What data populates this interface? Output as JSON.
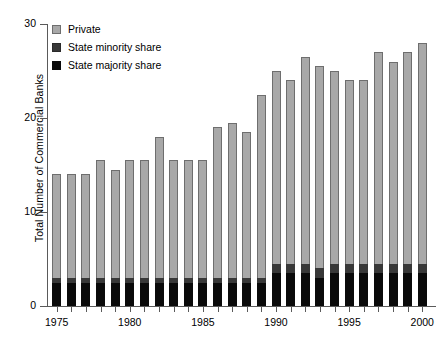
{
  "chart_data": {
    "type": "bar",
    "stacked": true,
    "title": "",
    "xlabel": "",
    "ylabel": "Total Number of Commercial Banks",
    "ylim": [
      0,
      30
    ],
    "yticks": [
      0,
      10,
      20,
      30
    ],
    "ytick_labels": [
      "0",
      "10",
      "20",
      "30"
    ],
    "grid": false,
    "legend_position": "top-left",
    "categories": [
      1975,
      1976,
      1977,
      1978,
      1979,
      1980,
      1981,
      1982,
      1983,
      1984,
      1985,
      1986,
      1987,
      1988,
      1989,
      1990,
      1991,
      1992,
      1993,
      1994,
      1995,
      1996,
      1997,
      1998,
      1999,
      2000
    ],
    "xtick_labels": [
      "1975",
      "1980",
      "1985",
      "1990",
      "1995",
      "2000"
    ],
    "xtick_values": [
      1975,
      1980,
      1985,
      1990,
      1995,
      2000
    ],
    "series": [
      {
        "name": "State majority share",
        "color": "#0a0a0a",
        "values": [
          2.5,
          2.5,
          2.5,
          2.5,
          2.5,
          2.5,
          2.5,
          2.5,
          2.5,
          2.5,
          2.5,
          2.5,
          2.5,
          2.5,
          2.5,
          3.5,
          3.5,
          3.5,
          3.0,
          3.5,
          3.5,
          3.5,
          3.5,
          3.5,
          3.5,
          3.5
        ]
      },
      {
        "name": "State minority share",
        "color": "#383838",
        "values": [
          0.5,
          0.5,
          0.5,
          0.5,
          0.5,
          0.5,
          0.5,
          0.5,
          0.5,
          0.5,
          0.5,
          0.5,
          0.5,
          0.5,
          0.5,
          1.0,
          1.0,
          1.0,
          1.0,
          1.0,
          1.0,
          1.0,
          1.0,
          1.0,
          1.0,
          1.0
        ]
      },
      {
        "name": "Private",
        "color": "#a8a8a8",
        "values": [
          11.0,
          11.0,
          11.0,
          12.5,
          11.5,
          12.5,
          12.5,
          15.0,
          12.5,
          12.5,
          12.5,
          16.0,
          16.5,
          15.5,
          19.5,
          20.5,
          19.5,
          22.0,
          21.5,
          20.5,
          19.5,
          19.5,
          22.5,
          21.5,
          22.5,
          23.5
        ]
      }
    ],
    "totals": [
      14,
      14,
      14,
      15.5,
      14.5,
      15.5,
      15.5,
      18,
      15.5,
      15.5,
      15.5,
      19,
      19.5,
      18.5,
      22.5,
      25,
      24,
      26.5,
      25.5,
      25,
      24,
      24,
      27,
      26,
      27,
      28
    ]
  },
  "legend": {
    "items": [
      {
        "label": "Private",
        "swatch": "private-swatch"
      },
      {
        "label": "State minority share",
        "swatch": "state-minority-swatch"
      },
      {
        "label": "State majority share",
        "swatch": "state-majority-swatch"
      }
    ]
  }
}
